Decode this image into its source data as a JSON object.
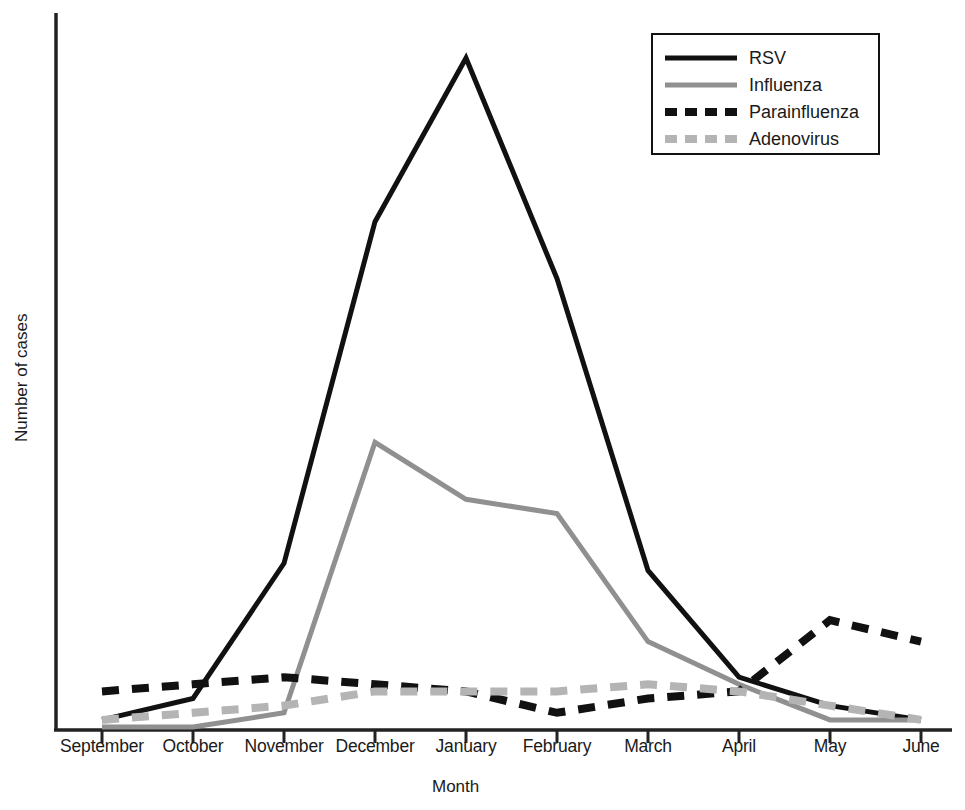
{
  "chart_data": {
    "type": "line",
    "title": "",
    "xlabel": "Month",
    "ylabel": "Number of cases",
    "grid": false,
    "legend_position": "top-right",
    "categories": [
      "September",
      "October",
      "November",
      "December",
      "January",
      "February",
      "March",
      "April",
      "May",
      "June"
    ],
    "axis": {
      "x_range": [
        "September",
        "June"
      ],
      "y_range": [
        0,
        100
      ],
      "y_ticks_shown": false,
      "x_ticks_shown": true
    },
    "series": [
      {
        "name": "RSV",
        "color": "#111111",
        "style": "solid",
        "values": [
          1,
          4,
          23,
          71,
          94,
          63,
          22,
          7,
          3,
          1
        ]
      },
      {
        "name": "Influenza",
        "color": "#909090",
        "style": "solid",
        "values": [
          0,
          0,
          2,
          40,
          32,
          30,
          12,
          6,
          1,
          1
        ]
      },
      {
        "name": "Parainfluenza",
        "color": "#111111",
        "style": "dashed",
        "values": [
          5,
          6,
          7,
          6,
          5,
          2,
          4,
          5,
          15,
          12
        ]
      },
      {
        "name": "Adenovirus",
        "color": "#b4b4b4",
        "style": "dashed",
        "values": [
          1,
          2,
          3,
          5,
          5,
          5,
          6,
          5,
          3,
          1
        ]
      }
    ]
  },
  "legend": {
    "entries": [
      {
        "label": "RSV",
        "swatch": "solid-black-line-icon"
      },
      {
        "label": "Influenza",
        "swatch": "solid-gray-line-icon"
      },
      {
        "label": "Parainfluenza",
        "swatch": "dashed-black-line-icon"
      },
      {
        "label": "Adenovirus",
        "swatch": "dashed-gray-line-icon"
      }
    ]
  },
  "colors": {
    "rsv": "#111111",
    "influenza": "#909090",
    "parainfluenza": "#111111",
    "adenovirus": "#b4b4b4",
    "axis": "#222222",
    "background": "#ffffff"
  }
}
